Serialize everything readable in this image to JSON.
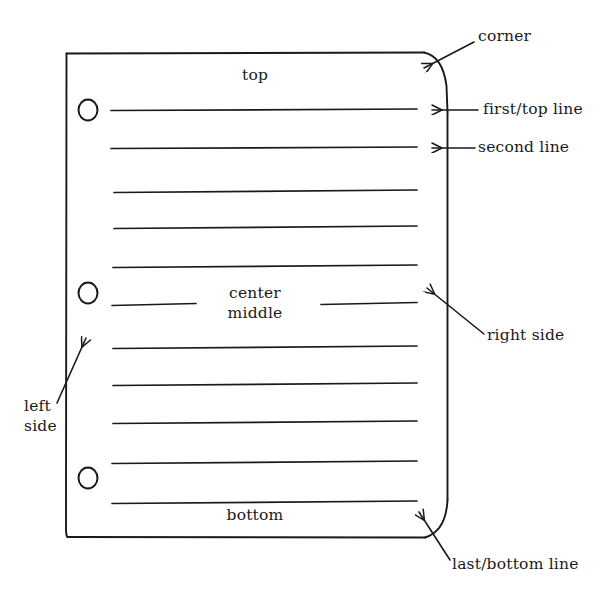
{
  "figure": {
    "type": "annotated-line-drawing",
    "background_color": "#ffffff",
    "ink_color": "#1a1a1a",
    "page": {
      "left_edge_x": 66,
      "right_edge_x": 448,
      "top_edge_y": 53,
      "bottom_edge_y": 538,
      "rounded_corners": [
        "top-right",
        "bottom-right"
      ],
      "punch_holes": 3,
      "ruled_lines": 11
    }
  },
  "inner_labels": {
    "top": "top",
    "center": "center",
    "middle": "middle",
    "bottom": "bottom"
  },
  "callouts": [
    {
      "id": "corner",
      "label": "corner",
      "points_to": "top-right rounded corner"
    },
    {
      "id": "first-top-line",
      "label": "first/top line",
      "points_to": "first ruled line"
    },
    {
      "id": "second-line",
      "label": "second line",
      "points_to": "second ruled line"
    },
    {
      "id": "right-side",
      "label": "right side",
      "points_to": "right edge of page"
    },
    {
      "id": "left-side",
      "label": "left\nside",
      "label_line1": "left",
      "label_line2": "side",
      "points_to": "left edge of page"
    },
    {
      "id": "last-bottom-line",
      "label": "last/bottom line",
      "points_to": "bottom-right corner / last line"
    }
  ],
  "ruled_line_y": [
    110,
    148,
    192,
    228,
    267,
    305,
    348,
    385,
    423,
    463,
    503
  ],
  "hole_centers": [
    {
      "x": 88,
      "y": 110
    },
    {
      "x": 88,
      "y": 293
    },
    {
      "x": 88,
      "y": 478
    }
  ]
}
